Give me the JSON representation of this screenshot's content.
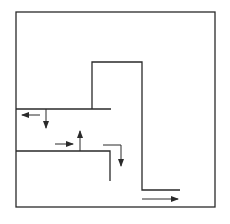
{
  "diagram": {
    "type": "flow-path-diagram",
    "stroke_color": "#2a2a2a",
    "background": "#ffffff",
    "boundary": {
      "x1": 16,
      "y1": 12,
      "x2": 215,
      "y2": 207
    },
    "walls": [
      {
        "name": "upper-ledge",
        "points": "16,109 111,109"
      },
      {
        "name": "tall-step",
        "points": "92,109 92,62 142,62 142,190 180,190"
      },
      {
        "name": "lower-ledge",
        "points": "16,151 110,151 110,181"
      }
    ],
    "arrows": [
      {
        "name": "arrow-left-upper",
        "x1": 40,
        "y1": 115,
        "x2": 22,
        "y2": 115
      },
      {
        "name": "arrow-down-upper",
        "x1": 46,
        "y1": 109,
        "x2": 46,
        "y2": 128
      },
      {
        "name": "arrow-right-middle",
        "x1": 55,
        "y1": 144,
        "x2": 73,
        "y2": 144
      },
      {
        "name": "arrow-up-middle",
        "x1": 80,
        "y1": 151,
        "x2": 80,
        "y2": 131
      },
      {
        "name": "arrow-bend-down",
        "points": "103,145 121,145 121,166"
      },
      {
        "name": "arrow-right-bottom",
        "x1": 142,
        "y1": 199,
        "x2": 178,
        "y2": 199
      }
    ]
  }
}
